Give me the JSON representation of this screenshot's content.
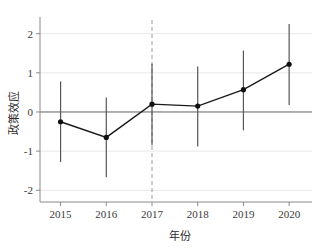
{
  "chart_data": {
    "type": "line",
    "title": "",
    "subtitle": "",
    "xlabel": "年份",
    "ylabel": "政策效应",
    "categories": [
      "2015",
      "2016",
      "2017",
      "2018",
      "2019",
      "2020"
    ],
    "x": [
      2015,
      2016,
      2017,
      2018,
      2019,
      2020
    ],
    "values": [
      -0.25,
      -0.65,
      0.2,
      0.15,
      0.57,
      1.22
    ],
    "ci_lower": [
      -1.28,
      -1.67,
      -0.85,
      -0.88,
      -0.47,
      0.18
    ],
    "ci_upper": [
      0.78,
      0.37,
      1.23,
      1.16,
      1.57,
      2.25
    ],
    "series": [
      {
        "name": "政策效应",
        "values": [
          -0.25,
          -0.65,
          0.2,
          0.15,
          0.57,
          1.22
        ],
        "ci_lower": [
          -1.28,
          -1.67,
          -0.85,
          -0.88,
          -0.47,
          0.18
        ],
        "ci_upper": [
          0.78,
          0.37,
          1.23,
          1.16,
          1.57,
          2.25
        ]
      }
    ],
    "ylim": [
      -2.3,
      2.35
    ],
    "xlim": [
      2014.55,
      2020.5
    ],
    "yticks": [
      -2,
      -1,
      0,
      1,
      2
    ],
    "ytick_labels": [
      "-2",
      "-1",
      "0",
      "1",
      "2"
    ],
    "xticks": [
      2015,
      2016,
      2017,
      2018,
      2019,
      2020
    ],
    "xtick_labels": [
      "2015",
      "2016",
      "2017",
      "2018",
      "2019",
      "2020"
    ],
    "grid": true,
    "grid_axis": "y",
    "legend": false,
    "legend_position": "none",
    "zero_line": 0,
    "reference_line": {
      "x": 2017,
      "style": "dashed",
      "orientation": "vertical"
    },
    "marker": "filled-circle",
    "errorbar_style": "plain-vertical-line",
    "colors": {
      "line": "#1a1a1a",
      "marker": "#111111",
      "errorbar": "#555555",
      "grid": "#e8e8e8",
      "axis": "#8a8a8a",
      "zero_line": "#6e6e6e",
      "reference_line": "#9a9a9a",
      "text": "#333333",
      "background": "#ffffff"
    }
  },
  "axis": {
    "y_title": "政策效应",
    "x_title": "年份",
    "y_ticks": [
      {
        "label": "2",
        "value": 2
      },
      {
        "label": "1",
        "value": 1
      },
      {
        "label": "0",
        "value": 0
      },
      {
        "label": "-1",
        "value": -1
      },
      {
        "label": "-2",
        "value": -2
      }
    ],
    "x_ticks": [
      {
        "label": "2015",
        "value": 2015
      },
      {
        "label": "2016",
        "value": 2016
      },
      {
        "label": "2017",
        "value": 2017
      },
      {
        "label": "2018",
        "value": 2018
      },
      {
        "label": "2019",
        "value": 2019
      },
      {
        "label": "2020",
        "value": 2020
      }
    ]
  },
  "points": [
    {
      "year": "2015",
      "estimate": "-0.25",
      "low": "-1.28",
      "high": "0.78"
    },
    {
      "year": "2016",
      "estimate": "-0.65",
      "low": "-1.67",
      "high": "0.37"
    },
    {
      "year": "2017",
      "estimate": "0.20",
      "low": "-0.85",
      "high": "1.23"
    },
    {
      "year": "2018",
      "estimate": "0.15",
      "low": "-0.88",
      "high": "1.16"
    },
    {
      "year": "2019",
      "estimate": "0.57",
      "low": "-0.47",
      "high": "1.57"
    },
    {
      "year": "2020",
      "estimate": "1.22",
      "low": "0.18",
      "high": "2.25"
    }
  ]
}
